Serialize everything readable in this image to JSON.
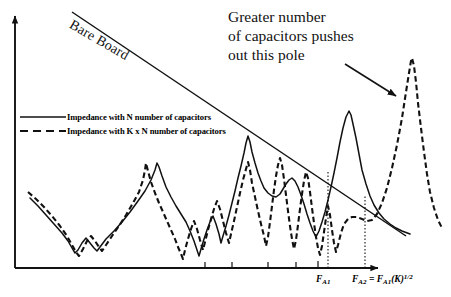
{
  "figure": {
    "bare_board_label": "Bare Board",
    "callout": {
      "line1": "Greater number",
      "line2": "of capacitors pushes",
      "line3": "out this pole"
    }
  },
  "legend": {
    "entries": [
      {
        "label": "Impedance with N number of  capacitors",
        "style": "solid"
      },
      {
        "label": "Impedance with K x N number of capacitors",
        "style": "dashed"
      }
    ]
  },
  "axis": {
    "x_markers": [
      {
        "id": "FA1",
        "base": "F",
        "sub": "A1",
        "rest": ""
      },
      {
        "id": "FA2",
        "base": "F",
        "sub": "A2",
        "rest": "= F"
      }
    ],
    "fa1_text": "F",
    "fa1_sub": "A1",
    "fa2_text": "F",
    "fa2_sub": "A2",
    "fa2_eq": " = F",
    "fa2_eq_sub": "A1",
    "fa2_tail": "(K)",
    "fa2_exp": "1/2"
  },
  "colors": {
    "ink": "#111111",
    "background": "#ffffff"
  },
  "chart_data": {
    "type": "line",
    "title": "",
    "xlabel": "Frequency",
    "ylabel": "Impedance",
    "grid": false,
    "legend_position": "upper-left",
    "axis_ranges": {
      "x": [
        0,
        1
      ],
      "y": [
        0,
        1
      ]
    },
    "annotations": [
      {
        "text": "Bare Board",
        "type": "line-label",
        "rotation_deg": 30
      },
      {
        "text": "Greater number of capacitors pushes out this pole",
        "type": "callout-with-arrow"
      }
    ],
    "x_markers": [
      {
        "label": "F_A1",
        "x_px": 328
      },
      {
        "label": "F_A2 = F_A1(K)^1/2",
        "x_px": 365
      }
    ],
    "series": [
      {
        "name": "Bare Board",
        "style": "solid",
        "description": "Monotonic decreasing straight line (inductive board impedance)",
        "points_px": [
          [
            72,
            12
          ],
          [
            405,
            235
          ]
        ]
      },
      {
        "name": "Impedance with N number of  capacitors",
        "style": "solid",
        "description": "Low-frequency decay to a series-resonance null, then alternating anti-resonance peaks; dominant pole near F_A1",
        "points_px": [
          [
            30,
            198
          ],
          [
            38,
            206
          ],
          [
            46,
            215
          ],
          [
            54,
            224
          ],
          [
            62,
            233
          ],
          [
            68,
            241
          ],
          [
            72,
            248
          ],
          [
            75,
            253
          ],
          [
            78,
            250
          ],
          [
            82,
            243
          ],
          [
            86,
            238
          ],
          [
            90,
            243
          ],
          [
            94,
            248
          ],
          [
            97,
            251
          ],
          [
            100,
            247
          ],
          [
            106,
            239
          ],
          [
            114,
            231
          ],
          [
            122,
            222
          ],
          [
            130,
            212
          ],
          [
            138,
            201
          ],
          [
            145,
            191
          ],
          [
            151,
            180
          ],
          [
            155,
            170
          ],
          [
            157,
            163
          ],
          [
            159,
            167
          ],
          [
            162,
            176
          ],
          [
            166,
            187
          ],
          [
            171,
            197
          ],
          [
            176,
            206
          ],
          [
            181,
            214
          ],
          [
            186,
            222
          ],
          [
            190,
            231
          ],
          [
            194,
            241
          ],
          [
            197,
            250
          ],
          [
            199,
            256
          ],
          [
            201,
            249
          ],
          [
            204,
            239
          ],
          [
            207,
            230
          ],
          [
            210,
            222
          ],
          [
            213,
            216
          ],
          [
            216,
            224
          ],
          [
            219,
            234
          ],
          [
            221,
            243
          ],
          [
            223,
            236
          ],
          [
            226,
            226
          ],
          [
            229,
            215
          ],
          [
            232,
            203
          ],
          [
            235,
            191
          ],
          [
            238,
            178
          ],
          [
            241,
            166
          ],
          [
            244,
            153
          ],
          [
            246,
            143
          ],
          [
            248,
            136
          ],
          [
            250,
            142
          ],
          [
            252,
            152
          ],
          [
            255,
            163
          ],
          [
            258,
            173
          ],
          [
            261,
            181
          ],
          [
            264,
            188
          ],
          [
            268,
            193
          ],
          [
            272,
            196
          ],
          [
            276,
            197
          ],
          [
            280,
            194
          ],
          [
            283,
            189
          ],
          [
            286,
            184
          ],
          [
            289,
            180
          ],
          [
            292,
            178
          ],
          [
            295,
            181
          ],
          [
            298,
            187
          ],
          [
            301,
            195
          ],
          [
            304,
            204
          ],
          [
            307,
            214
          ],
          [
            310,
            223
          ],
          [
            313,
            231
          ],
          [
            316,
            237
          ],
          [
            319,
            231
          ],
          [
            322,
            222
          ],
          [
            325,
            212
          ],
          [
            328,
            200
          ],
          [
            331,
            187
          ],
          [
            334,
            173
          ],
          [
            337,
            158
          ],
          [
            340,
            142
          ],
          [
            343,
            128
          ],
          [
            346,
            117
          ],
          [
            349,
            111
          ],
          [
            351,
            115
          ],
          [
            353,
            124
          ],
          [
            356,
            138
          ],
          [
            359,
            154
          ],
          [
            362,
            170
          ],
          [
            366,
            184
          ],
          [
            370,
            196
          ],
          [
            374,
            205
          ],
          [
            379,
            213
          ],
          [
            384,
            219
          ],
          [
            390,
            224
          ],
          [
            396,
            228
          ],
          [
            402,
            231
          ],
          [
            410,
            234
          ]
        ]
      },
      {
        "name": "Impedance with K x N number of capacitors",
        "style": "dashed",
        "description": "Same shape but lower impedance and anti-resonances pushed higher in frequency; dense oscillation band then far-right dominant pole beyond F_A2",
        "points_px": [
          [
            28,
            192
          ],
          [
            36,
            199
          ],
          [
            44,
            207
          ],
          [
            52,
            216
          ],
          [
            60,
            226
          ],
          [
            67,
            236
          ],
          [
            72,
            245
          ],
          [
            76,
            252
          ],
          [
            79,
            256
          ],
          [
            83,
            249
          ],
          [
            87,
            241
          ],
          [
            91,
            236
          ],
          [
            95,
            241
          ],
          [
            99,
            247
          ],
          [
            102,
            251
          ],
          [
            106,
            245
          ],
          [
            112,
            236
          ],
          [
            119,
            226
          ],
          [
            126,
            215
          ],
          [
            133,
            203
          ],
          [
            139,
            192
          ],
          [
            143,
            180
          ],
          [
            145,
            170
          ],
          [
            146,
            163
          ],
          [
            148,
            171
          ],
          [
            151,
            182
          ],
          [
            155,
            193
          ],
          [
            159,
            203
          ],
          [
            163,
            212
          ],
          [
            167,
            221
          ],
          [
            171,
            230
          ],
          [
            175,
            239
          ],
          [
            178,
            247
          ],
          [
            181,
            254
          ],
          [
            183,
            259
          ],
          [
            185,
            250
          ],
          [
            188,
            239
          ],
          [
            191,
            229
          ],
          [
            194,
            221
          ],
          [
            197,
            229
          ],
          [
            200,
            240
          ],
          [
            203,
            250
          ],
          [
            205,
            242
          ],
          [
            208,
            230
          ],
          [
            211,
            219
          ],
          [
            214,
            209
          ],
          [
            217,
            201
          ],
          [
            220,
            209
          ],
          [
            223,
            221
          ],
          [
            226,
            233
          ],
          [
            229,
            243
          ],
          [
            231,
            234
          ],
          [
            234,
            221
          ],
          [
            237,
            207
          ],
          [
            240,
            193
          ],
          [
            243,
            180
          ],
          [
            246,
            169
          ],
          [
            248,
            162
          ],
          [
            250,
            170
          ],
          [
            252,
            183
          ],
          [
            255,
            197
          ],
          [
            258,
            211
          ],
          [
            261,
            224
          ],
          [
            264,
            236
          ],
          [
            266,
            246
          ],
          [
            268,
            237
          ],
          [
            270,
            222
          ],
          [
            272,
            206
          ],
          [
            274,
            190
          ],
          [
            276,
            176
          ],
          [
            278,
            165
          ],
          [
            280,
            158
          ],
          [
            282,
            165
          ],
          [
            284,
            179
          ],
          [
            286,
            195
          ],
          [
            288,
            211
          ],
          [
            290,
            226
          ],
          [
            292,
            239
          ],
          [
            294,
            249
          ],
          [
            296,
            240
          ],
          [
            298,
            225
          ],
          [
            300,
            209
          ],
          [
            302,
            194
          ],
          [
            304,
            181
          ],
          [
            306,
            172
          ],
          [
            308,
            178
          ],
          [
            310,
            192
          ],
          [
            312,
            208
          ],
          [
            314,
            223
          ],
          [
            316,
            237
          ],
          [
            318,
            248
          ],
          [
            320,
            255
          ],
          [
            322,
            246
          ],
          [
            324,
            232
          ],
          [
            326,
            218
          ],
          [
            328,
            206
          ],
          [
            330,
            215
          ],
          [
            332,
            230
          ],
          [
            334,
            243
          ],
          [
            336,
            252
          ],
          [
            338,
            245
          ],
          [
            341,
            233
          ],
          [
            344,
            224
          ],
          [
            348,
            219
          ],
          [
            352,
            217
          ],
          [
            357,
            217
          ],
          [
            362,
            219
          ],
          [
            367,
            221
          ],
          [
            372,
            220
          ],
          [
            377,
            214
          ],
          [
            382,
            203
          ],
          [
            387,
            188
          ],
          [
            392,
            168
          ],
          [
            397,
            145
          ],
          [
            402,
            118
          ],
          [
            406,
            92
          ],
          [
            409,
            73
          ],
          [
            411,
            61
          ],
          [
            412,
            58
          ],
          [
            414,
            66
          ],
          [
            416,
            82
          ],
          [
            418,
            103
          ],
          [
            421,
            128
          ],
          [
            424,
            152
          ],
          [
            427,
            174
          ],
          [
            430,
            192
          ],
          [
            434,
            208
          ],
          [
            438,
            220
          ],
          [
            442,
            228
          ]
        ]
      }
    ]
  }
}
